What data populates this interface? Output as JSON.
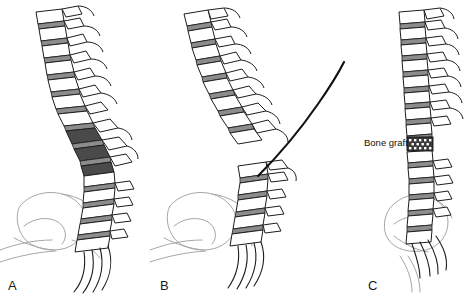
{
  "figure": {
    "background_color": "#ffffff",
    "ink_color": "#1d1d1d",
    "disc_color": "#8c8c8c",
    "deformity_color": "#4a4a4a",
    "pelvis_color": "#a6a6a6",
    "graft_color": "#3a3a3a",
    "width": 465,
    "height": 297
  },
  "panels": [
    {
      "id": "a",
      "letter": "A",
      "letter_x": 8,
      "letter_y": 290,
      "caption": "Preoperative kyphotic spine deformity with collapsed apical vertebrae shaded dark",
      "vertebra_count": 17,
      "has_pelvis": true,
      "has_deformity_shading": true,
      "has_osteotomy_line": false,
      "has_bone_graft": false
    },
    {
      "id": "b",
      "letter": "B",
      "letter_x": 160,
      "letter_y": 290,
      "caption": "Osteotomy: spine divided into mobilized upper segment and fixed lower segment with resection line",
      "vertebra_count": 15,
      "has_pelvis": true,
      "has_deformity_shading": false,
      "has_osteotomy_line": true,
      "has_bone_graft": false
    },
    {
      "id": "c",
      "letter": "C",
      "letter_x": 368,
      "letter_y": 290,
      "caption": "Corrected, realigned spine stabilized with interbody bone graft",
      "vertebra_count": 17,
      "has_pelvis": true,
      "has_deformity_shading": false,
      "has_osteotomy_line": false,
      "has_bone_graft": true
    }
  ],
  "annotations": [
    {
      "id": "bone-graft",
      "text": "Bone graft",
      "x": 364,
      "y": 146,
      "panel": "c",
      "target_x": 414,
      "target_y": 143
    }
  ]
}
